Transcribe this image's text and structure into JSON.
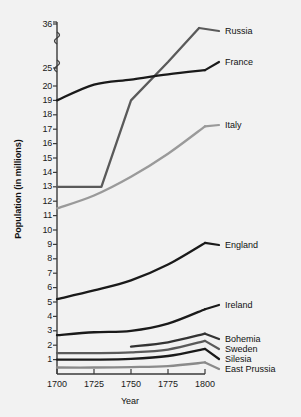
{
  "chart_data": {
    "type": "line",
    "title": "",
    "xlabel": "Year",
    "ylabel": "Population (in millions)",
    "x": [
      1700,
      1725,
      1750,
      1775,
      1800
    ],
    "xtick_labels": [
      "1700",
      "1725",
      "1750",
      "1775",
      "1800"
    ],
    "xlim": [
      1700,
      1800
    ],
    "ytick_labels": [
      "1",
      "2",
      "3",
      "4",
      "5",
      "6",
      "7",
      "8",
      "9",
      "10",
      "11",
      "12",
      "13",
      "14",
      "15",
      "16",
      "17",
      "18",
      "19",
      "20",
      "25",
      "36"
    ],
    "ytick_values": [
      1,
      2,
      3,
      4,
      5,
      6,
      7,
      8,
      9,
      10,
      11,
      12,
      13,
      14,
      15,
      16,
      17,
      18,
      19,
      20,
      25,
      36
    ],
    "axis_break": true,
    "axis_break_note": "y-axis broken above 20; 25 and 36 compressed",
    "grid": false,
    "legend_position": "right-inline",
    "series": [
      {
        "name": "Russia",
        "color": "#5a5a5a",
        "x": [
          1700,
          1725,
          1730,
          1750,
          1775,
          1796
        ],
        "values": [
          13,
          13,
          13,
          19,
          26.5,
          35
        ]
      },
      {
        "name": "France",
        "color": "#1a1a1a",
        "x": [
          1700,
          1725,
          1750,
          1775,
          1800
        ],
        "values": [
          19,
          20.4,
          21.8,
          23.2,
          24.4
        ]
      },
      {
        "name": "Italy",
        "color": "#9a9a9a",
        "x": [
          1700,
          1725,
          1750,
          1775,
          1800
        ],
        "values": [
          11.5,
          12.4,
          13.7,
          15.3,
          17.2
        ]
      },
      {
        "name": "England",
        "color": "#1a1a1a",
        "x": [
          1700,
          1725,
          1750,
          1775,
          1800
        ],
        "values": [
          5.2,
          5.8,
          6.5,
          7.6,
          9.1
        ]
      },
      {
        "name": "Ireland",
        "color": "#1a1a1a",
        "x": [
          1700,
          1725,
          1750,
          1775,
          1800
        ],
        "values": [
          2.7,
          2.9,
          3.0,
          3.5,
          4.5
        ]
      },
      {
        "name": "Bohemia",
        "color": "#333333",
        "x": [
          1750,
          1775,
          1800
        ],
        "values": [
          1.9,
          2.2,
          2.8
        ]
      },
      {
        "name": "Sweden",
        "color": "#5a5a5a",
        "x": [
          1700,
          1725,
          1750,
          1775,
          1800
        ],
        "values": [
          1.45,
          1.45,
          1.5,
          1.7,
          2.3
        ]
      },
      {
        "name": "Silesia",
        "color": "#1a1a1a",
        "x": [
          1700,
          1725,
          1750,
          1775,
          1800
        ],
        "values": [
          1.0,
          1.0,
          1.05,
          1.25,
          1.75
        ]
      },
      {
        "name": "East Prussia",
        "color": "#8a8a8a",
        "x": [
          1700,
          1725,
          1750,
          1775,
          1800
        ],
        "values": [
          0.45,
          0.45,
          0.48,
          0.55,
          0.8
        ]
      }
    ],
    "series_label_positions": [
      {
        "name": "Russia",
        "left": 225,
        "top": 26
      },
      {
        "name": "France",
        "left": 225,
        "top": 57
      },
      {
        "name": "Italy",
        "left": 225,
        "top": 120
      },
      {
        "name": "England",
        "left": 225,
        "top": 240
      },
      {
        "name": "Ireland",
        "left": 225,
        "top": 300
      },
      {
        "name": "Bohemia",
        "left": 225,
        "top": 334
      },
      {
        "name": "Sweden",
        "left": 225,
        "top": 344
      },
      {
        "name": "Silesia",
        "left": 225,
        "top": 354
      },
      {
        "name": "East Prussia",
        "left": 225,
        "top": 364
      }
    ]
  }
}
